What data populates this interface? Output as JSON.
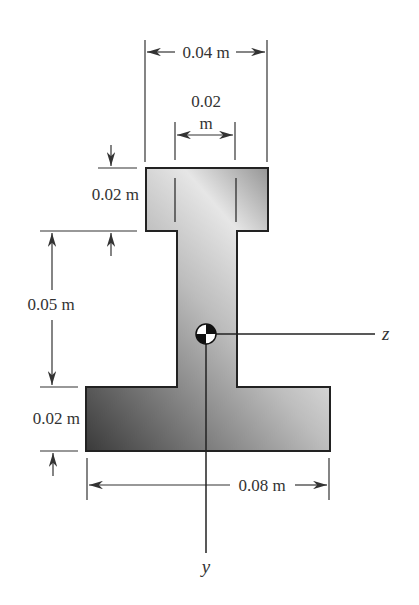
{
  "figure": {
    "type": "cross-section"
  },
  "dimensions": {
    "top_flange_width": "0.04 m",
    "web_width_num": "0.02",
    "web_width_unit": "m",
    "top_flange_thickness": "0.02 m",
    "web_height": "0.05 m",
    "bottom_flange_thickness": "0.02 m",
    "bottom_flange_width": "0.08 m"
  },
  "axes": {
    "horizontal": "z",
    "vertical": "y"
  },
  "colors": {
    "shape_dark": "#3a3a3a",
    "shape_light": "#e6e6e6",
    "line": "#333333"
  }
}
